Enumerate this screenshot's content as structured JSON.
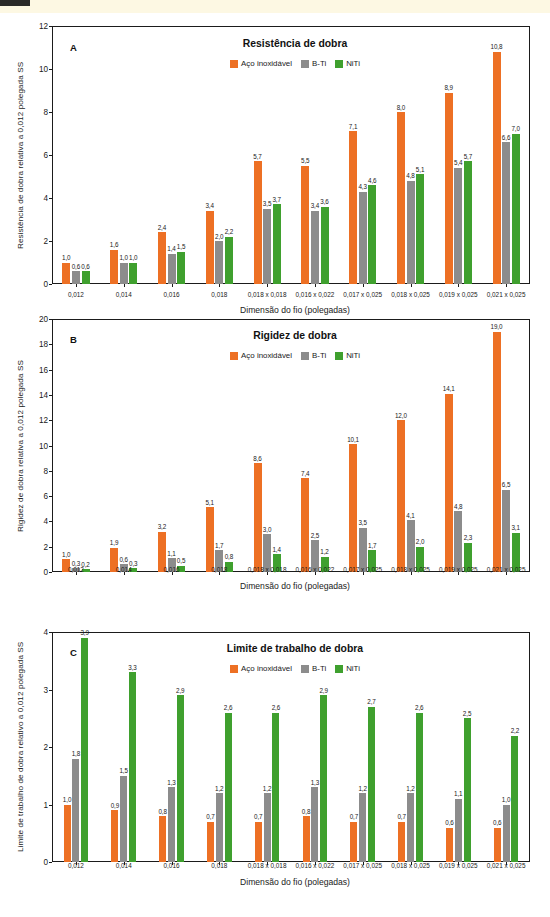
{
  "figure": {
    "xaxis_title": "Dimensão do fio (polegadas)",
    "categories": [
      "0,012",
      "0,014",
      "0,016",
      "0,018",
      "0,018 x 0,018",
      "0,016 x 0,022",
      "0,017 x 0,025",
      "0,018 x 0,025",
      "0,019 x 0,025",
      "0,021 x 0,025"
    ],
    "series_names": [
      "Aço inoxidável",
      "B-Ti",
      "NiTi"
    ],
    "colors": {
      "stainless": "#ED7024",
      "bti": "#8C8C8C",
      "niti": "#3FA02E",
      "axis": "#1b1b1b",
      "background": "#ffffff",
      "topband": "#fdf8e3"
    }
  },
  "panelA": {
    "letter": "A",
    "title": "Resistência de dobra",
    "ylabel": "Resistência de dobra relativa a 0,012 polegada SS",
    "yticks": [
      "0",
      "2",
      "4",
      "6",
      "8",
      "10",
      "12"
    ]
  },
  "panelB": {
    "letter": "B",
    "title": "Rigidez de dobra",
    "ylabel": "Rigidez de dobra relativa a 0,012 polegada SS",
    "yticks": [
      "0",
      "2",
      "4",
      "6",
      "8",
      "10",
      "12",
      "14",
      "16",
      "18",
      "20"
    ]
  },
  "panelC": {
    "letter": "C",
    "title": "Limite de trabalho de dobra",
    "ylabel": "Limite de trabalho de dobra relativo a 0,012 polegada SS",
    "yticks": [
      "0",
      "1",
      "2",
      "3",
      "4"
    ]
  },
  "chart_data": [
    {
      "type": "bar",
      "title": "Resistência de dobra",
      "panel": "A",
      "xlabel": "Dimensão do fio (polegadas)",
      "ylabel": "Resistência de dobra relativa a 0,012 polegada SS",
      "ylim": [
        0,
        12
      ],
      "ytick_step": 2,
      "grid": false,
      "legend_position": "top-center",
      "categories": [
        "0,012",
        "0,014",
        "0,016",
        "0,018",
        "0,018 x 0,018",
        "0,016 x 0,022",
        "0,017 x 0,025",
        "0,018 x 0,025",
        "0,019 x 0,025",
        "0,021 x 0,025"
      ],
      "series": [
        {
          "name": "Aço inoxidável",
          "color": "#ED7024",
          "values": [
            1.0,
            1.6,
            2.4,
            3.4,
            5.7,
            5.5,
            7.1,
            8.0,
            8.9,
            10.8
          ],
          "labels": [
            "1,0",
            "1,6",
            "2,4",
            "3,4",
            "5,7",
            "5,5",
            "7,1",
            "8,0",
            "8,9",
            "10,8"
          ]
        },
        {
          "name": "B-Ti",
          "color": "#8C8C8C",
          "values": [
            0.6,
            1.0,
            1.4,
            2.0,
            3.5,
            3.4,
            4.3,
            4.8,
            5.4,
            6.6
          ],
          "labels": [
            "0,6",
            "1,0",
            "1,4",
            "2,0",
            "3,5",
            "3,4",
            "4,3",
            "4,8",
            "5,4",
            "6,6"
          ]
        },
        {
          "name": "NiTi",
          "color": "#3FA02E",
          "values": [
            0.6,
            1.0,
            1.5,
            2.2,
            3.7,
            3.6,
            4.6,
            5.1,
            5.7,
            7.0
          ],
          "labels": [
            "0,6",
            "1,0",
            "1,5",
            "2,2",
            "3,7",
            "3,6",
            "4,6",
            "5,1",
            "5,7",
            "7,0"
          ]
        }
      ]
    },
    {
      "type": "bar",
      "title": "Rigidez de dobra",
      "panel": "B",
      "xlabel": "Dimensão do fio (polegadas)",
      "ylabel": "Rigidez de dobra relativa a 0,012 polegada SS",
      "ylim": [
        0,
        20
      ],
      "ytick_step": 2,
      "grid": false,
      "legend_position": "top-center",
      "categories": [
        "0,012",
        "0,014",
        "0,016",
        "0,018",
        "0,018 x 0,018",
        "0,016 x 0,022",
        "0,017 x 0,025",
        "0,018 x 0,025",
        "0,019 x 0,025",
        "0,021 x 0,025"
      ],
      "series": [
        {
          "name": "Aço inoxidável",
          "color": "#ED7024",
          "values": [
            1.0,
            1.9,
            3.2,
            5.1,
            8.6,
            7.4,
            10.1,
            12.0,
            14.1,
            19.0
          ],
          "labels": [
            "1,0",
            "1,9",
            "3,2",
            "5,1",
            "8,6",
            "7,4",
            "10,1",
            "12,0",
            "14,1",
            "19,0"
          ]
        },
        {
          "name": "B-Ti",
          "color": "#8C8C8C",
          "values": [
            0.3,
            0.6,
            1.1,
            1.7,
            3.0,
            2.5,
            3.5,
            4.1,
            4.8,
            6.5
          ],
          "labels": [
            "0,3",
            "0,6",
            "1,1",
            "1,7",
            "3,0",
            "2,5",
            "3,5",
            "4,1",
            "4,8",
            "6,5"
          ]
        },
        {
          "name": "NiTi",
          "color": "#3FA02E",
          "values": [
            0.2,
            0.3,
            0.5,
            0.8,
            1.4,
            1.2,
            1.7,
            2.0,
            2.3,
            3.1
          ],
          "labels": [
            "0,2",
            "0,3",
            "0,5",
            "0,8",
            "1,4",
            "1,2",
            "1,7",
            "2,0",
            "2,3",
            "3,1"
          ]
        }
      ]
    },
    {
      "type": "bar",
      "title": "Limite de trabalho de dobra",
      "panel": "C",
      "xlabel": "Dimensão do fio (polegadas)",
      "ylabel": "Limite de trabalho de dobra relativo a 0,012 polegada SS",
      "ylim": [
        0,
        4
      ],
      "ytick_step": 1,
      "grid": false,
      "legend_position": "top-center",
      "categories": [
        "0,012",
        "0,014",
        "0,016",
        "0,018",
        "0,018 x 0,018",
        "0,016 x 0,022",
        "0,017 x 0,025",
        "0,018 x 0,025",
        "0,019 x 0,025",
        "0,021 x 0,025"
      ],
      "series": [
        {
          "name": "Aço inoxidável",
          "color": "#ED7024",
          "values": [
            1.0,
            0.9,
            0.8,
            0.7,
            0.7,
            0.8,
            0.7,
            0.7,
            0.6,
            0.6
          ],
          "labels": [
            "1,0",
            "0,9",
            "0,8",
            "0,7",
            "0,7",
            "0,8",
            "0,7",
            "0,7",
            "0,6",
            "0,6"
          ]
        },
        {
          "name": "B-Ti",
          "color": "#8C8C8C",
          "values": [
            1.8,
            1.5,
            1.3,
            1.2,
            1.2,
            1.3,
            1.2,
            1.2,
            1.1,
            1.0
          ],
          "labels": [
            "1,8",
            "1,5",
            "1,3",
            "1,2",
            "1,2",
            "1,3",
            "1,2",
            "1,2",
            "1,1",
            "1,0"
          ]
        },
        {
          "name": "NiTi",
          "color": "#3FA02E",
          "values": [
            3.9,
            3.3,
            2.9,
            2.6,
            2.6,
            2.9,
            2.7,
            2.6,
            2.5,
            2.2
          ],
          "labels": [
            "3,9",
            "3,3",
            "2,9",
            "2,6",
            "2,6",
            "2,9",
            "2,7",
            "2,6",
            "2,5",
            "2,2"
          ]
        }
      ]
    }
  ]
}
